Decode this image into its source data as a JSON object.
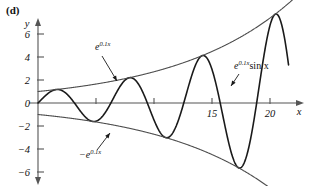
{
  "panel": {
    "label": "(d)"
  },
  "chart_data": {
    "type": "line",
    "title": "",
    "xlabel": "x",
    "ylabel": "y",
    "xlim": [
      -0.6,
      22.5
    ],
    "ylim": [
      -7.2,
      7.2
    ],
    "grid": false,
    "legend": "none",
    "x_ticks": [
      5,
      10,
      15,
      20
    ],
    "x_tick_labels": [
      "",
      "",
      "15",
      "20"
    ],
    "y_ticks": [
      -6,
      -4,
      -2,
      0,
      2,
      4,
      6
    ],
    "y_tick_labels": [
      "−6",
      "−4",
      "−2",
      "0",
      "2",
      "4",
      "6"
    ],
    "series": [
      {
        "name": "e^{0.1x} sin x",
        "expression": "exp(0.1*x)*sin(x)",
        "role": "main",
        "color": "#1a1a1a",
        "stroke_width": 1.6,
        "x_range": [
          0,
          21.6
        ],
        "key_points": [
          {
            "x": 0,
            "y": 0
          },
          {
            "x": 1.47,
            "y": 1.16
          },
          {
            "x": 4.62,
            "y": -1.59
          },
          {
            "x": 7.75,
            "y": 2.17
          },
          {
            "x": 10.9,
            "y": -2.97
          },
          {
            "x": 14.05,
            "y": 4.07
          },
          {
            "x": 17.2,
            "y": -5.57
          },
          {
            "x": 21.6,
            "y": 6.6
          }
        ]
      },
      {
        "name": "e^{0.1x}",
        "expression": "exp(0.1*x)",
        "role": "upper-envelope",
        "color": "#4d4d4d",
        "stroke_width": 1.1,
        "x_range": [
          0,
          22.0
        ],
        "key_points": [
          {
            "x": 0,
            "y": 1.0
          },
          {
            "x": 5,
            "y": 1.65
          },
          {
            "x": 10,
            "y": 2.72
          },
          {
            "x": 15,
            "y": 4.48
          },
          {
            "x": 20,
            "y": 7.39
          }
        ]
      },
      {
        "name": "−e^{0.1x}",
        "expression": "-exp(0.1*x)",
        "role": "lower-envelope",
        "color": "#4d4d4d",
        "stroke_width": 1.1,
        "x_range": [
          0,
          22.0
        ],
        "key_points": [
          {
            "x": 0,
            "y": -1.0
          },
          {
            "x": 5,
            "y": -1.65
          },
          {
            "x": 10,
            "y": -2.72
          },
          {
            "x": 15,
            "y": -4.48
          },
          {
            "x": 20,
            "y": -7.39
          }
        ]
      }
    ],
    "annotations": [
      {
        "id": "upper-envelope-label",
        "base": "e",
        "exponent": "0.1x",
        "suffix": "",
        "text": "e^{0.1x}",
        "label_x": 95,
        "label_y": 50,
        "arrow": {
          "x1": 102,
          "y1": 56,
          "x2": 117,
          "y2": 81
        }
      },
      {
        "id": "main-curve-label",
        "base": "e",
        "exponent": "0.1x",
        "suffix": "sin x",
        "text": "e^{0.1x}sin x",
        "label_x": 234,
        "label_y": 69,
        "arrow": {
          "x1": 239,
          "y1": 74,
          "x2": 231,
          "y2": 86
        }
      },
      {
        "id": "lower-envelope-label",
        "base": "−e",
        "exponent": "0.1x",
        "suffix": "",
        "text": "−e^{0.1x}",
        "label_x": 79,
        "label_y": 158,
        "arrow": {
          "x1": 97,
          "y1": 150,
          "x2": 110,
          "y2": 133
        }
      }
    ]
  }
}
